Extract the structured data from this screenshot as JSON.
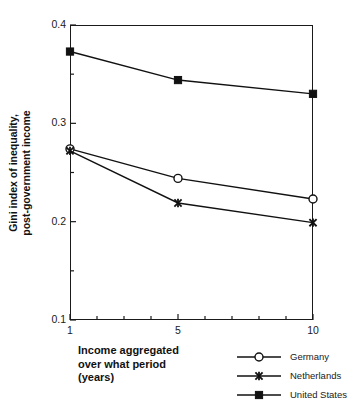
{
  "chart_data": {
    "type": "line",
    "title": "",
    "subtitle": "",
    "xlabel": "Income aggregated over what period (years)",
    "xlabel_lines": [
      "Income aggregated",
      "over what period",
      "(years)"
    ],
    "ylabel": "Gini index of inequality, post-government income",
    "ylabel_lines": [
      "Gini index of inequality,",
      "post-government income"
    ],
    "x": [
      1,
      5,
      10
    ],
    "xlim": [
      1,
      10
    ],
    "ylim": [
      0.1,
      0.4
    ],
    "xticks": [
      1,
      2,
      3,
      4,
      5,
      6,
      7,
      8,
      9,
      10
    ],
    "xtick_labels": [
      {
        "value": 1,
        "label": "1"
      },
      {
        "value": 5,
        "label": "5"
      },
      {
        "value": 10,
        "label": "10"
      }
    ],
    "yticks_major": [
      0.1,
      0.2,
      0.3,
      0.4
    ],
    "ytick_labels": [
      "0.1",
      "0.2",
      "0.3",
      "0.4"
    ],
    "yticks_minor": [
      0.15,
      0.25,
      0.35
    ],
    "grid": false,
    "legend_position": "bottom-right",
    "series": [
      {
        "name": "Germany",
        "marker": "open-circle",
        "values": [
          0.274,
          0.244,
          0.223
        ]
      },
      {
        "name": "Netherlands",
        "marker": "cross",
        "values": [
          0.272,
          0.219,
          0.199
        ]
      },
      {
        "name": "United States",
        "marker": "filled-square",
        "values": [
          0.373,
          0.344,
          0.33
        ]
      }
    ],
    "line_color": "#111111",
    "frame_color": "#1a1a1a"
  },
  "legend": {
    "items": [
      {
        "label": "Germany",
        "marker": "open-circle"
      },
      {
        "label": "Netherlands",
        "marker": "cross"
      },
      {
        "label": "United States",
        "marker": "filled-square"
      }
    ]
  }
}
